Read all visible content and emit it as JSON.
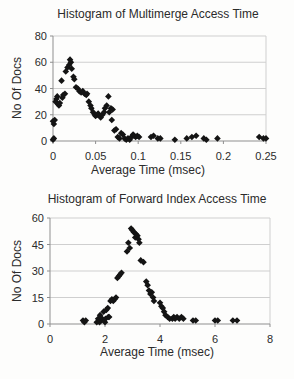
{
  "figure": {
    "background": "#fdfdfc",
    "marker_shape": "diamond",
    "marker_color": "#141414",
    "gridline_color": "#cfcfcf",
    "axis_color": "#8f8f8f"
  },
  "chart_data": [
    {
      "type": "scatter",
      "title": "Histogram of Multimerge Access Time",
      "xlabel": "Average Time (msec)",
      "ylabel": "No Of Docs",
      "xlim": [
        0,
        0.25
      ],
      "ylim": [
        0,
        80
      ],
      "xticks": [
        0,
        0.05,
        0.1,
        0.15,
        0.2,
        0.25
      ],
      "xtick_labels": [
        "0",
        "0.05",
        "0.1",
        "0.15",
        "0.2",
        "0.25"
      ],
      "yticks": [
        0,
        20,
        40,
        60,
        80
      ],
      "ytick_labels": [
        "0",
        "20",
        "40",
        "60",
        "80"
      ],
      "grid": "horizontal",
      "legend": "none",
      "points": [
        [
          0.0,
          1
        ],
        [
          0.001,
          2
        ],
        [
          0.0,
          15
        ],
        [
          0.001,
          13
        ],
        [
          0.002,
          16
        ],
        [
          0.003,
          30
        ],
        [
          0.004,
          32
        ],
        [
          0.005,
          34
        ],
        [
          0.006,
          28
        ],
        [
          0.007,
          27
        ],
        [
          0.008,
          29
        ],
        [
          0.01,
          46
        ],
        [
          0.011,
          33
        ],
        [
          0.012,
          35
        ],
        [
          0.014,
          36
        ],
        [
          0.015,
          53
        ],
        [
          0.017,
          56
        ],
        [
          0.019,
          58
        ],
        [
          0.02,
          62
        ],
        [
          0.021,
          60
        ],
        [
          0.022,
          55
        ],
        [
          0.024,
          49
        ],
        [
          0.025,
          47
        ],
        [
          0.027,
          41
        ],
        [
          0.029,
          40
        ],
        [
          0.031,
          38
        ],
        [
          0.033,
          37
        ],
        [
          0.035,
          38
        ],
        [
          0.037,
          36
        ],
        [
          0.039,
          35
        ],
        [
          0.04,
          36
        ],
        [
          0.042,
          30
        ],
        [
          0.044,
          27
        ],
        [
          0.045,
          25
        ],
        [
          0.047,
          22
        ],
        [
          0.049,
          20
        ],
        [
          0.05,
          19
        ],
        [
          0.052,
          20
        ],
        [
          0.053,
          21
        ],
        [
          0.055,
          19
        ],
        [
          0.056,
          18
        ],
        [
          0.058,
          20
        ],
        [
          0.06,
          22
        ],
        [
          0.061,
          25
        ],
        [
          0.063,
          27
        ],
        [
          0.065,
          34
        ],
        [
          0.066,
          22
        ],
        [
          0.068,
          25
        ],
        [
          0.069,
          16
        ],
        [
          0.07,
          24
        ],
        [
          0.072,
          8
        ],
        [
          0.074,
          9
        ],
        [
          0.076,
          3
        ],
        [
          0.078,
          2
        ],
        [
          0.08,
          6
        ],
        [
          0.082,
          5
        ],
        [
          0.084,
          2
        ],
        [
          0.086,
          1
        ],
        [
          0.088,
          2
        ],
        [
          0.09,
          1
        ],
        [
          0.092,
          3
        ],
        [
          0.094,
          5
        ],
        [
          0.095,
          4
        ],
        [
          0.097,
          3
        ],
        [
          0.099,
          4
        ],
        [
          0.101,
          3
        ],
        [
          0.115,
          3
        ],
        [
          0.118,
          4
        ],
        [
          0.123,
          2
        ],
        [
          0.126,
          2
        ],
        [
          0.143,
          1
        ],
        [
          0.157,
          2
        ],
        [
          0.163,
          3
        ],
        [
          0.168,
          4
        ],
        [
          0.177,
          2
        ],
        [
          0.18,
          1
        ],
        [
          0.193,
          2
        ],
        [
          0.242,
          3
        ],
        [
          0.247,
          2
        ],
        [
          0.25,
          2
        ]
      ]
    },
    {
      "type": "scatter",
      "title": "Histogram of Forward Index Access Time",
      "xlabel": "Average Time (msec)",
      "ylabel": "No Of Docs",
      "xlim": [
        0,
        8
      ],
      "ylim": [
        0,
        60
      ],
      "xticks": [
        0,
        2,
        4,
        6,
        8
      ],
      "xtick_labels": [
        "0",
        "2",
        "4",
        "6",
        "8"
      ],
      "yticks": [
        0,
        15,
        30,
        45,
        60
      ],
      "ytick_labels": [
        "0",
        "15",
        "30",
        "45",
        "60"
      ],
      "grid": "horizontal",
      "legend": "none",
      "points": [
        [
          1.2,
          2
        ],
        [
          1.25,
          1
        ],
        [
          1.3,
          2
        ],
        [
          1.7,
          1
        ],
        [
          1.75,
          3
        ],
        [
          1.8,
          1
        ],
        [
          1.82,
          5
        ],
        [
          1.85,
          2
        ],
        [
          1.9,
          3
        ],
        [
          1.95,
          7
        ],
        [
          2.0,
          1
        ],
        [
          2.02,
          3
        ],
        [
          2.05,
          8
        ],
        [
          2.1,
          9
        ],
        [
          2.12,
          4
        ],
        [
          2.15,
          4
        ],
        [
          2.2,
          13
        ],
        [
          2.25,
          14
        ],
        [
          2.3,
          13
        ],
        [
          2.35,
          14
        ],
        [
          2.4,
          15
        ],
        [
          2.45,
          26
        ],
        [
          2.5,
          27
        ],
        [
          2.55,
          28
        ],
        [
          2.6,
          29
        ],
        [
          2.8,
          41
        ],
        [
          2.85,
          46
        ],
        [
          2.9,
          43
        ],
        [
          2.95,
          54
        ],
        [
          3.0,
          53
        ],
        [
          3.05,
          52
        ],
        [
          3.1,
          49
        ],
        [
          3.12,
          51
        ],
        [
          3.18,
          50
        ],
        [
          3.22,
          48
        ],
        [
          3.25,
          46
        ],
        [
          3.3,
          36
        ],
        [
          3.4,
          35
        ],
        [
          3.5,
          24
        ],
        [
          3.55,
          22
        ],
        [
          3.6,
          19
        ],
        [
          3.65,
          17
        ],
        [
          3.7,
          18
        ],
        [
          3.75,
          15
        ],
        [
          3.78,
          13
        ],
        [
          4.0,
          12
        ],
        [
          4.05,
          10
        ],
        [
          4.1,
          9
        ],
        [
          4.15,
          7
        ],
        [
          4.2,
          5
        ],
        [
          4.28,
          4
        ],
        [
          4.35,
          3
        ],
        [
          4.45,
          3
        ],
        [
          4.5,
          4
        ],
        [
          4.55,
          3
        ],
        [
          4.62,
          4
        ],
        [
          4.7,
          3
        ],
        [
          4.78,
          4
        ],
        [
          4.85,
          3
        ],
        [
          5.2,
          2
        ],
        [
          5.3,
          2
        ],
        [
          6.0,
          2
        ],
        [
          6.1,
          2
        ],
        [
          6.65,
          2
        ],
        [
          6.8,
          2
        ]
      ]
    }
  ]
}
